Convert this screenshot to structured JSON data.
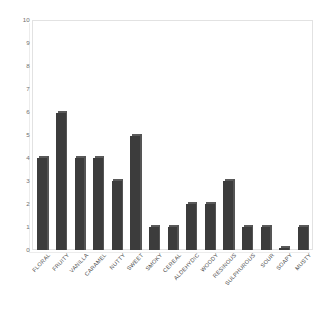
{
  "chart_data": {
    "type": "bar",
    "title": "",
    "subtitle": "",
    "xlabel": "",
    "ylabel": "",
    "categories": [
      "FLORAL",
      "FRUITY",
      "VANILLA",
      "CARAMEL",
      "NUTTY",
      "SWEET",
      "SMOKY",
      "CEREAL",
      "ALDEHYDIC",
      "WOODY",
      "RESINOUS",
      "SULPHUROUS",
      "SOUR",
      "SOAPY",
      "MUSTY"
    ],
    "values": [
      4,
      6,
      4,
      4,
      3,
      5,
      1,
      1,
      2,
      2,
      3,
      1,
      1,
      0.1,
      1
    ],
    "ylim": [
      0,
      10
    ],
    "yticks": [
      0,
      1,
      2,
      3,
      4,
      5,
      6,
      7,
      8,
      9,
      10
    ],
    "ytick_labels": [
      "0",
      "1",
      "2",
      "3",
      "4",
      "5",
      "6",
      "7",
      "8",
      "9",
      "10"
    ],
    "grid": false,
    "legend": null,
    "bar_color": "#3c3c3c",
    "plot_background": "#ffffff",
    "frame_color": "#e2e2e2",
    "tick_label_color": "#6f6f6f",
    "category_label_color": "#4d4d4d",
    "category_label_rotation_deg": -47
  }
}
